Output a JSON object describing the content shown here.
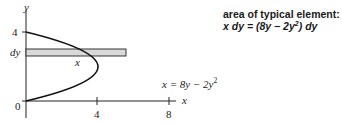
{
  "diagram": {
    "axes": {
      "x_label": "x",
      "y_label": "y",
      "origin_label": "0",
      "x_ticks": [
        "4",
        "8"
      ],
      "y_ticks": [
        "4"
      ],
      "y_strip_label": "dy"
    },
    "curve": {
      "equation_lhs": "x = 8y − 2y",
      "equation_exp": "2",
      "vertex": [
        8,
        2
      ],
      "y_intercepts": [
        0,
        4
      ]
    },
    "strip": {
      "label": "x",
      "fill_color": "#d9d9d9",
      "stroke_color": "#222222"
    },
    "annotation": {
      "title": "area of typical element:",
      "formula_part1": "x dy = (8y − 2y",
      "formula_exp": "2",
      "formula_part2": ") dy"
    }
  }
}
